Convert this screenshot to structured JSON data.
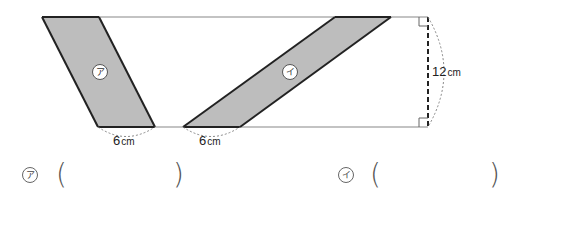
{
  "figure": {
    "shape_a_label": "ア",
    "shape_b_label": "イ",
    "base_a": {
      "value": "6",
      "unit": "cm"
    },
    "base_b": {
      "value": "6",
      "unit": "cm"
    },
    "height": {
      "value": "12",
      "unit": "cm"
    },
    "colors": {
      "fill": "#bdbdbd",
      "outline": "#222222",
      "lines": "#888888"
    }
  },
  "answers": [
    {
      "label": "ア",
      "open": "(",
      "close": ")",
      "value": ""
    },
    {
      "label": "イ",
      "open": "(",
      "close": ")",
      "value": ""
    }
  ]
}
